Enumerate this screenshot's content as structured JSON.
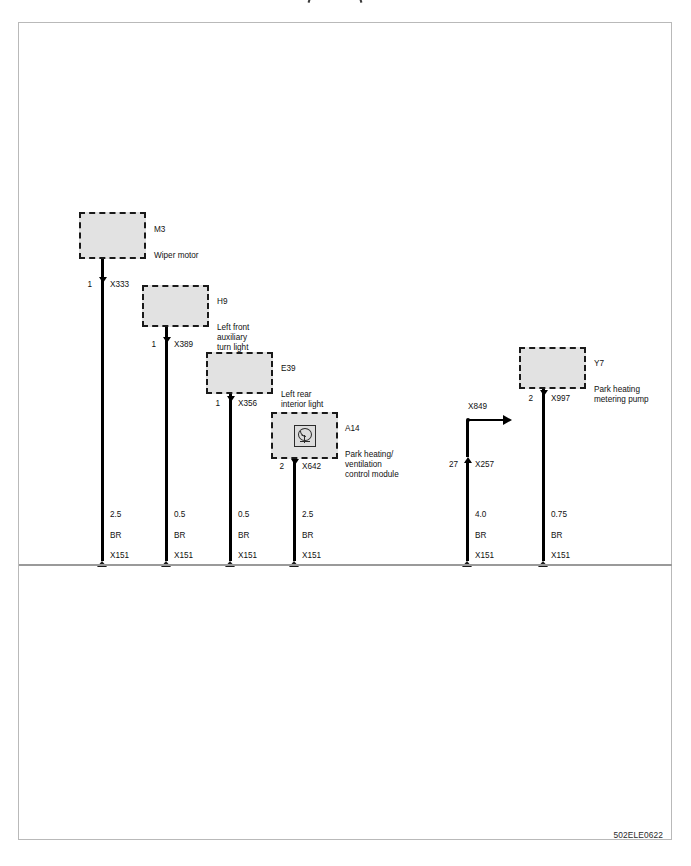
{
  "diagram": {
    "footer_code": "502ELE0622",
    "ground_bus_label": "X151",
    "components": [
      {
        "code": "M3",
        "description": "Wiper motor",
        "pin": "1",
        "connector": "X333",
        "wire_size": "2.5",
        "wire_color": "BR",
        "ground": "X151",
        "icon": "none"
      },
      {
        "code": "H9",
        "description": "Left front\nauxiliary\nturn light",
        "pin": "1",
        "connector": "X389",
        "wire_size": "0.5",
        "wire_color": "BR",
        "ground": "X151",
        "icon": "none"
      },
      {
        "code": "E39",
        "description": "Left rear\ninterior light",
        "pin": "1",
        "connector": "X356",
        "wire_size": "0.5",
        "wire_color": "BR",
        "ground": "X151",
        "icon": "none"
      },
      {
        "code": "A14",
        "description": "Park heating/\nventilation\ncontrol module",
        "pin": "2",
        "connector": "X642",
        "wire_size": "2.5",
        "wire_color": "BR",
        "ground": "X151",
        "icon": "fan-icon"
      },
      {
        "code": "Y7",
        "description": "Park heating\nmetering  pump",
        "pin": "2",
        "connector": "X997",
        "wire_size": "0.75",
        "wire_color": "BR",
        "ground": "X151",
        "icon": "none"
      }
    ],
    "branch": {
      "pin": "27",
      "connector": "X257",
      "target_connector": "X849",
      "wire_size": "4.0",
      "wire_color": "BR",
      "ground": "X151"
    }
  }
}
